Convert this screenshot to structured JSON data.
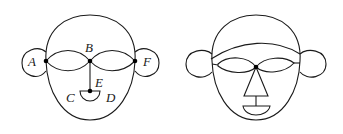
{
  "figures": [
    {
      "name": "labeled-face-graph",
      "labels": {
        "A": "A",
        "B": "B",
        "C": "C",
        "D": "D",
        "E": "E",
        "F": "F"
      }
    },
    {
      "name": "face-drawing",
      "labels": {}
    }
  ],
  "colors": {
    "stroke": "#1a1a1a",
    "background": "#ffffff"
  }
}
